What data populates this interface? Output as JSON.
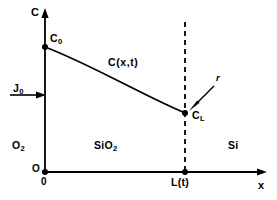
{
  "figure": {
    "type": "schematic-plot",
    "background": "#ffffff",
    "stroke_color": "#000000",
    "width": 277,
    "height": 200
  },
  "axes": {
    "y_label": "C",
    "x_label": "x",
    "origin_y_label": "O",
    "origin_x_label": "0",
    "x_axis": {
      "x_start": 45,
      "x_end": 266,
      "y": 172
    },
    "y_axis": {
      "x": 45,
      "y_start": 172,
      "y_end": 11
    }
  },
  "flux": {
    "label": "J",
    "sub": "0",
    "arrow": {
      "x_start": 10,
      "x_end": 45,
      "y": 95
    }
  },
  "points": [
    {
      "name": "C0",
      "label": "C",
      "sub": "0",
      "x": 45,
      "y": 47,
      "label_dx": 6,
      "label_dy": -16
    },
    {
      "name": "CL",
      "label": "C",
      "sub": "L",
      "x": 185,
      "y": 113,
      "label_dx": 7,
      "label_dy": -5
    },
    {
      "name": "Lt",
      "label": "L(t)",
      "sub": "",
      "x": 185,
      "y": 172,
      "label_dx": -12,
      "label_dy": 6
    }
  ],
  "curve": {
    "label": "C(x,t)",
    "label_x": 108,
    "label_y": 63,
    "path": "M 45 47 C 90 64, 140 94, 185 113",
    "stroke_width": 1.8
  },
  "interface": {
    "name": "L(t)-interface",
    "x": 185,
    "y_top": 22,
    "y_bottom": 172,
    "dash": "5,4",
    "stroke_width": 1.8
  },
  "annotation": {
    "label": "r",
    "label_x": 216,
    "label_y": 78,
    "leader": {
      "x_start": 213,
      "y_start": 88,
      "x_end": 190,
      "y_end": 110
    }
  },
  "regions": [
    {
      "name": "oxygen",
      "label": "O",
      "sub": "2",
      "x": 12,
      "y": 145
    },
    {
      "name": "oxide",
      "label": "SiO",
      "sub": "2",
      "x": 94,
      "y": 145
    },
    {
      "name": "silicon",
      "label": "Si",
      "sub": "",
      "x": 230,
      "y": 145
    }
  ]
}
